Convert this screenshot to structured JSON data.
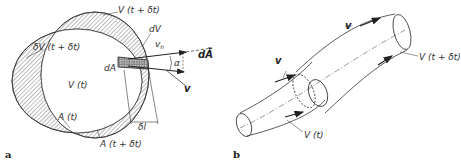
{
  "panel_a": {
    "letter": "a",
    "labels": {
      "v_t_dt": "V (t + δt)",
      "dV": "dV",
      "vn": "v",
      "vn_sub": "n",
      "dA_vec": "dA",
      "dV_t_dt": "δV (t + δt)",
      "dA_small": "dA",
      "alpha": "α",
      "v": "v",
      "v_t": "V (t)",
      "a_t": "A (t)",
      "dl": "δl",
      "a_t_dt": "A (t + δt)"
    }
  },
  "panel_b": {
    "letter": "b",
    "labels": {
      "v_top": "v",
      "v_left": "v",
      "v_t_dt": "V (t + δt)",
      "v_t": "V (t)"
    }
  }
}
